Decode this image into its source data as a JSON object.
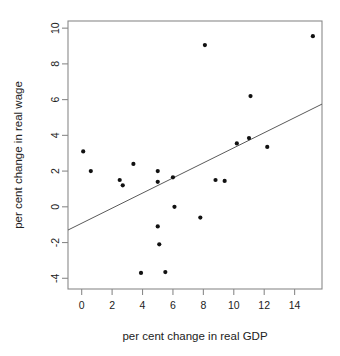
{
  "chart_data": {
    "type": "scatter",
    "title": "",
    "xlabel": "per cent change in real GDP",
    "ylabel": "per cent change in real wage",
    "xlim": [
      -0.9,
      15.8
    ],
    "ylim": [
      -4.6,
      10.4
    ],
    "xticks": [
      0,
      2,
      4,
      6,
      8,
      10,
      12,
      14
    ],
    "xtick_labels": [
      "0",
      "2",
      "4",
      "6",
      "8",
      "10",
      "12",
      "14"
    ],
    "yticks": [
      -4,
      -2,
      0,
      2,
      4,
      6,
      8,
      10
    ],
    "ytick_labels": [
      "-4",
      "-2",
      "0",
      "2",
      "4",
      "6",
      "8",
      "10"
    ],
    "grid": false,
    "legend": false,
    "points": [
      {
        "x": 0.1,
        "y": 3.1
      },
      {
        "x": 0.6,
        "y": 2.0
      },
      {
        "x": 2.5,
        "y": 1.5
      },
      {
        "x": 2.7,
        "y": 1.2
      },
      {
        "x": 3.4,
        "y": 2.4
      },
      {
        "x": 3.9,
        "y": -3.7
      },
      {
        "x": 5.0,
        "y": 2.0
      },
      {
        "x": 5.0,
        "y": 1.4
      },
      {
        "x": 5.0,
        "y": -1.1
      },
      {
        "x": 5.1,
        "y": -2.1
      },
      {
        "x": 5.5,
        "y": -3.65
      },
      {
        "x": 6.0,
        "y": 1.65
      },
      {
        "x": 6.1,
        "y": 0.0
      },
      {
        "x": 7.8,
        "y": -0.6
      },
      {
        "x": 8.1,
        "y": 9.05
      },
      {
        "x": 8.8,
        "y": 1.5
      },
      {
        "x": 9.4,
        "y": 1.45
      },
      {
        "x": 10.2,
        "y": 3.55
      },
      {
        "x": 11.0,
        "y": 3.85
      },
      {
        "x": 11.1,
        "y": 6.2
      },
      {
        "x": 12.2,
        "y": 3.35
      },
      {
        "x": 15.2,
        "y": 9.55
      }
    ],
    "trend_line": {
      "type": "linear-fit",
      "x_start": -0.9,
      "y_start": -1.3,
      "x_end": 15.8,
      "y_end": 5.75
    }
  }
}
